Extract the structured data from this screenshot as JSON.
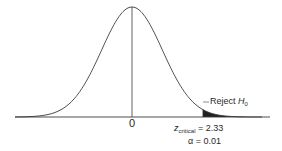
{
  "chart_data": {
    "type": "area",
    "title": "",
    "distribution": "standard normal",
    "mean": 0,
    "xlabel": "",
    "ylabel": "",
    "x_ticks": [
      0
    ],
    "grid": false,
    "critical_value": {
      "symbol": "z",
      "subscript": "critical",
      "value": 2.33,
      "label": "= 2.33"
    },
    "alpha": {
      "symbol": "α",
      "value": 0.01,
      "label": "= 0.01"
    },
    "shaded_region": {
      "from_z": 2.33,
      "to_z": "inf",
      "tail": "right",
      "label": "Reject H",
      "label_subscript": "0"
    },
    "colors": {
      "curve": "#3a3a3a",
      "shade": "#1f1f1f",
      "axis": "#3a3a3a"
    }
  },
  "labels": {
    "zero": "0",
    "z_symbol": "z",
    "z_sub": "critical",
    "z_value": "= 2.33",
    "alpha_text": "α = 0.01",
    "reject": "Reject ",
    "reject_h": "H",
    "reject_sub": "0"
  }
}
